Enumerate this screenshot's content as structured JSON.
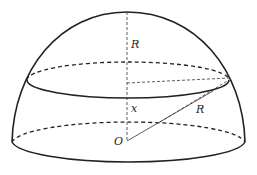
{
  "diagram": {
    "labels": {
      "top_radius": "R",
      "height": "x",
      "slant_radius": "R",
      "origin": "O"
    },
    "colors": {
      "stroke": "#222222",
      "background": "#ffffff"
    },
    "geometry": {
      "center": [
        127,
        141
      ],
      "apex": [
        127,
        12
      ],
      "base_ellipse": {
        "cx": 128,
        "cy": 142,
        "rx": 117,
        "ry": 22
      },
      "section_ellipse": {
        "cx": 128,
        "cy": 80,
        "rx": 101,
        "ry": 18
      },
      "section_edge_point": [
        229,
        80
      ]
    }
  }
}
